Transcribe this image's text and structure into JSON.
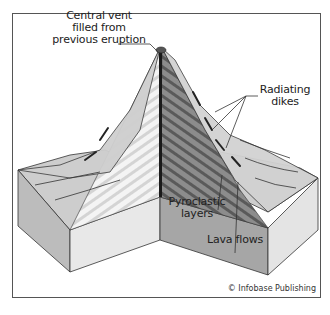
{
  "diagram": {
    "labels": {
      "central_vent": [
        "Central vent",
        "filled from",
        "previous eruption"
      ],
      "radiating_dikes": [
        "Radiating",
        "dikes"
      ],
      "pyroclastic_layers": [
        "Pyroclastic",
        "layers"
      ],
      "lava_flows": "Lava flows"
    },
    "credit": "© Infobase Publishing",
    "colors": {
      "frame": "#555555",
      "cutaway_light": "#f2f2f2",
      "cutaway_stripe_light": "#d6d6d6",
      "cutaway_dark": "#8a8a8a",
      "cutaway_stripe_dark": "#5c5c5c",
      "slope_surface": "#c8c8c8",
      "block_front": "#e6e6e6",
      "block_side": "#bdbdbd",
      "ground_top": "#cfcfcf",
      "lines": "#333333"
    }
  }
}
